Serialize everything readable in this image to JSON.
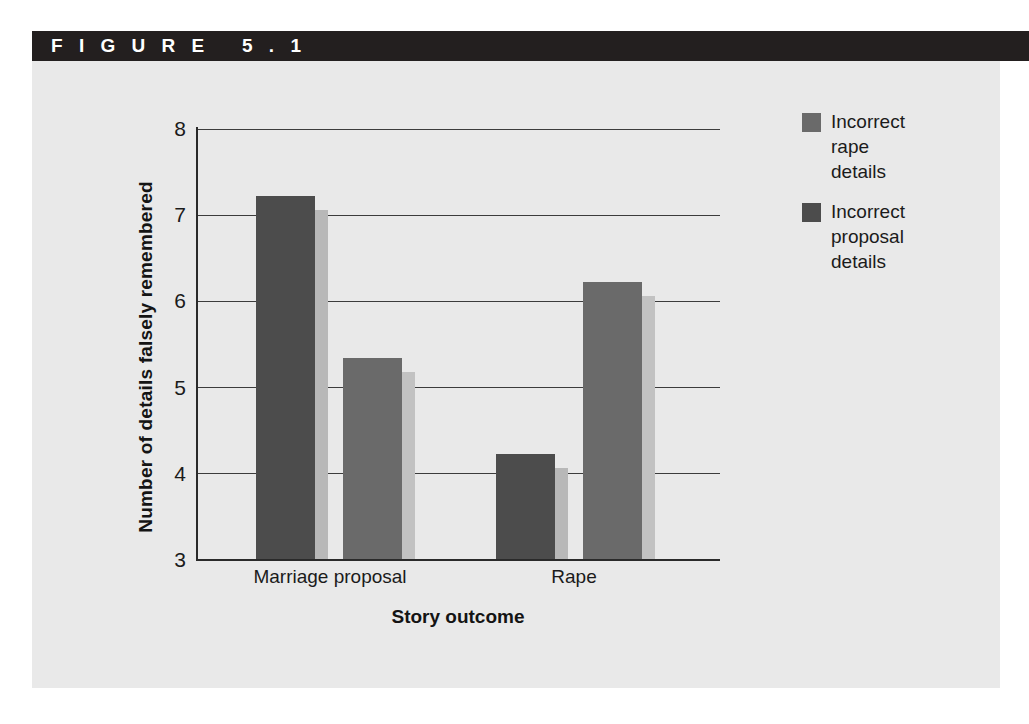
{
  "figure": {
    "header_label": "F I G U R E   5 . 1",
    "header_bg": "#231f1f",
    "panel_bg": "#e9e9e9"
  },
  "chart_data": {
    "type": "bar",
    "title": "",
    "xlabel": "Story outcome",
    "ylabel": "Number of details falsely remembered",
    "categories": [
      "Marriage proposal",
      "Rape"
    ],
    "ylim": [
      3,
      8
    ],
    "yticks": [
      "8",
      "7",
      "6",
      "5",
      "4",
      "3"
    ],
    "ytick_values": [
      8,
      7,
      6,
      5,
      4,
      3
    ],
    "grid": true,
    "legend_position": "right",
    "series": [
      {
        "name": "Incorrect rape details",
        "color": "#4c4c4c",
        "side_color": "#b8b8b8",
        "values": [
          7.22,
          4.22
        ]
      },
      {
        "name": "Incorrect proposal details",
        "color": "#6a6a6a",
        "side_color": "#c2c2c2",
        "values": [
          5.34,
          6.22
        ]
      }
    ]
  },
  "legend": {
    "entries": [
      {
        "label": "Incorrect\nrape\ndetails",
        "color": "#6a6a6a"
      },
      {
        "label": "Incorrect\nproposal\ndetails",
        "color": "#4c4c4c"
      }
    ]
  },
  "axis": {
    "y_title": "Number of details falsely remembered",
    "x_title": "Story outcome",
    "ytick_8": "8",
    "ytick_7": "7",
    "ytick_6": "6",
    "ytick_5": "5",
    "ytick_4": "4",
    "ytick_3": "3",
    "xtick_0": "Marriage proposal",
    "xtick_1": "Rape"
  }
}
